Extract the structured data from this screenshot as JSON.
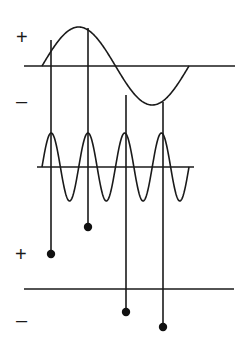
{
  "diagram": {
    "colors": {
      "line": "#1a1a1a",
      "background": "#ffffff",
      "dot": "#111111"
    },
    "top_panel": {
      "plus_label": "+",
      "minus_label": "–",
      "axis": {
        "x1": 24,
        "x2": 235,
        "y": 66
      },
      "wave": {
        "x_start": 42,
        "x_end": 189,
        "periods": 1,
        "amplitude": 39
      }
    },
    "middle_panel": {
      "axis": {
        "x1": 37,
        "x2": 194,
        "y": 167
      },
      "wave": {
        "x_start": 42,
        "x_end": 189,
        "periods": 4,
        "amplitude": 34
      }
    },
    "bottom_panel": {
      "plus_label": "+",
      "minus_label": "–",
      "axis": {
        "x1": 24,
        "x2": 234,
        "y": 289
      }
    },
    "sample_lines": [
      {
        "x": 51,
        "y_top": 40,
        "dot_y": 254
      },
      {
        "x": 88,
        "y_top": 28,
        "dot_y": 227
      },
      {
        "x": 126,
        "y_top": 95,
        "dot_y": 312
      },
      {
        "x": 163,
        "y_top": 102,
        "dot_y": 327
      }
    ]
  }
}
